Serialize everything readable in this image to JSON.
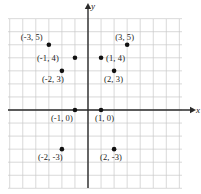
{
  "figure": {
    "type": "coordinate-plane",
    "axis_labels": {
      "x": "x",
      "y": "y"
    },
    "colors": {
      "background": "#ffffff",
      "grid": "#c8c8c8",
      "axis": "#2b2b2b",
      "point": "#111111",
      "text": "#1a1a1a"
    },
    "grid": {
      "left_px": 8,
      "right_px": 182,
      "top_px": 19,
      "bottom_px": 188,
      "cell_px": 13.05,
      "origin_x_px": 88,
      "origin_y_px": 110,
      "x_range": [
        -6,
        7
      ],
      "y_range": [
        -6,
        7
      ],
      "show_tick_numbers": false
    }
  },
  "chart_data": {
    "type": "scatter",
    "title": "",
    "xlabel": "x",
    "ylabel": "y",
    "xlim": [
      -6,
      7
    ],
    "ylim": [
      -6,
      7
    ],
    "grid": true,
    "legend": false,
    "points": [
      {
        "label": "(-3, 5)",
        "x": -3,
        "y": 5,
        "label_dx": -28,
        "label_dy": -12
      },
      {
        "label": "(3, 5)",
        "x": 3,
        "y": 5,
        "label_dx": -12,
        "label_dy": -12
      },
      {
        "label": "(-1, 4)",
        "x": -1,
        "y": 4,
        "label_dx": -38,
        "label_dy": -4
      },
      {
        "label": "(1, 4)",
        "x": 1,
        "y": 4,
        "label_dx": 5,
        "label_dy": -4
      },
      {
        "label": "(-2, 3)",
        "x": -2,
        "y": 3,
        "label_dx": -20,
        "label_dy": 4
      },
      {
        "label": "(2, 3)",
        "x": 2,
        "y": 3,
        "label_dx": -10,
        "label_dy": 4
      },
      {
        "label": "(-1, 0)",
        "x": -1,
        "y": 0,
        "label_dx": -24,
        "label_dy": 4
      },
      {
        "label": "(1, 0)",
        "x": 1,
        "y": 0,
        "label_dx": -6,
        "label_dy": 4
      },
      {
        "label": "(-2, -3)",
        "x": -2,
        "y": -3,
        "label_dx": -24,
        "label_dy": 4
      },
      {
        "label": "(2, -3)",
        "x": 2,
        "y": -3,
        "label_dx": -14,
        "label_dy": 4
      }
    ]
  }
}
